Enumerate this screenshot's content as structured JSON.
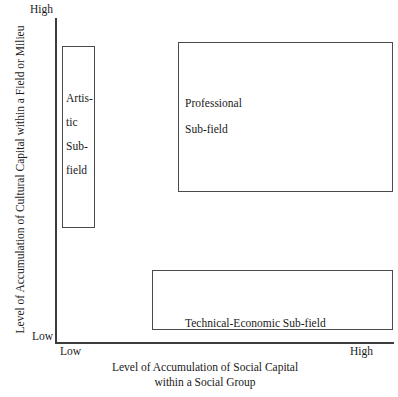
{
  "diagram": {
    "type": "conceptual-quadrant-diagram",
    "axes": {
      "y": {
        "title": "Level of Accumulation of Cultural Capital within a Field or Milieu",
        "high_label": "High",
        "low_label": "Low"
      },
      "x": {
        "title_line1": "Level of Accumulation of Social Capital",
        "title_line2": "within a Social Group",
        "low_label": "Low",
        "high_label": "High"
      }
    },
    "boxes": [
      {
        "id": "artistic",
        "label_lines": [
          "Artis-",
          "tic",
          "Sub-",
          "field"
        ],
        "label_full": "Artistic Sub-field"
      },
      {
        "id": "professional",
        "label_lines": [
          "Professional",
          "Sub-field"
        ],
        "label_full": "Professional Sub-field"
      },
      {
        "id": "technical",
        "label_lines": [
          "Technical-Economic Sub-field"
        ],
        "label_full": "Technical-Economic Sub-field"
      }
    ],
    "colors": {
      "background": "#ffffff",
      "box_border": "#4a4a4a",
      "axis_line": "#3c3c3c",
      "text": "#1a1a1a"
    }
  }
}
